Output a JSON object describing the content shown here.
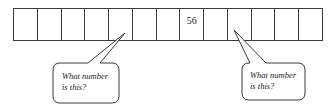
{
  "number_line": {
    "cell_count": 13,
    "cells": [
      "",
      "",
      "",
      "",
      "",
      "",
      "",
      "56",
      "",
      "",
      "",
      "",
      ""
    ],
    "known_value": "56",
    "known_index": 7
  },
  "callouts": [
    {
      "target_index": 4,
      "line1": "What number",
      "line2": "is this?"
    },
    {
      "target_index": 9,
      "line1": "What number",
      "line2": "is this?"
    }
  ],
  "colors": {
    "stroke": "#3a3a3a",
    "text": "#222222",
    "background": "#ffffff"
  }
}
